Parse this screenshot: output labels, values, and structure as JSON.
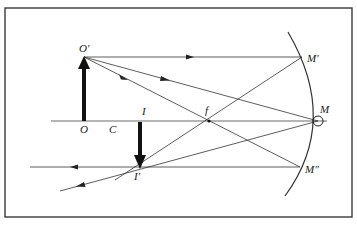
{
  "diagram": {
    "type": "concave-mirror-ray-diagram",
    "colors": {
      "line": "#333333",
      "frame": "#3a3a3a",
      "arrow": "#111111",
      "background": "#ffffff"
    },
    "labels": {
      "object_top": "O′",
      "object_base": "O",
      "center": "C",
      "image_base": "I",
      "image_tip": "I′",
      "focus": "f",
      "mirror_top": "M′",
      "mirror_vertex": "M",
      "mirror_bottom": "M″"
    },
    "points": {
      "O_prime": [
        84,
        57
      ],
      "O": [
        84,
        121
      ],
      "C": [
        112,
        121
      ],
      "I": [
        140,
        121
      ],
      "I_prime": [
        140,
        168
      ],
      "f": [
        209,
        121
      ],
      "M_prime": [
        302,
        57
      ],
      "M": [
        318,
        121
      ],
      "M_double_prime": [
        300,
        167
      ]
    },
    "rays": [
      "O′ parallel to axis → M′, reflects through f to I′",
      "O′ through f → M″, reflects parallel to axis through I′",
      "O′ → M (vertex), reflects to I′ and beyond"
    ]
  }
}
